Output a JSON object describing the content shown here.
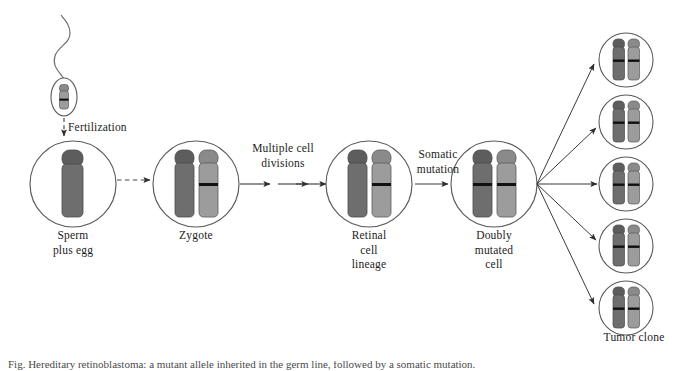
{
  "diagram": {
    "colors": {
      "outline": "#555555",
      "chromosome_dark": "#6e6e6e",
      "chromosome_light": "#9c9c9c",
      "chromosome_cap_dark": "#5d5d5d",
      "chromosome_cap_light": "#8a8a8a",
      "mutation_band": "#111111",
      "arrow": "#3a3a3a",
      "text": "#1c1c1c",
      "background": "#ffffff"
    },
    "stages": [
      {
        "id": "sperm-egg",
        "label": "Sperm\nplus egg",
        "cx": 73,
        "cy": 184,
        "r": 43,
        "chromosomes": [
          {
            "shade": "dark",
            "mutated": false
          }
        ]
      },
      {
        "id": "zygote",
        "label": "Zygote",
        "cx": 196,
        "cy": 184,
        "r": 43,
        "chromosomes": [
          {
            "shade": "dark",
            "mutated": false
          },
          {
            "shade": "light",
            "mutated": true
          }
        ]
      },
      {
        "id": "retinal-cell-lineage",
        "label": "Retinal\ncell\nlineage",
        "cx": 369,
        "cy": 184,
        "r": 43,
        "chromosomes": [
          {
            "shade": "dark",
            "mutated": false
          },
          {
            "shade": "light",
            "mutated": true
          }
        ]
      },
      {
        "id": "doubly-mutated-cell",
        "label": "Doubly\nmutated\ncell",
        "cx": 494,
        "cy": 184,
        "r": 43,
        "chromosomes": [
          {
            "shade": "dark",
            "mutated": true
          },
          {
            "shade": "light",
            "mutated": true
          }
        ]
      }
    ],
    "gamete": {
      "id": "sperm",
      "head_cx": 64,
      "head_cy": 97,
      "head_rx": 13,
      "head_ry": 19,
      "chromosome": {
        "shade": "light",
        "mutated": true
      }
    },
    "steps": [
      {
        "id": "fertilization",
        "label": "Fertilization",
        "x": 70,
        "y": 120,
        "style": "dashed-vertical"
      },
      {
        "id": "multiple-cell-divisions",
        "label": "Multiple cell\ndivisions",
        "x": 240,
        "y": 142,
        "style": "triple-arrow"
      },
      {
        "id": "somatic-mutation",
        "label": "Somatic\nmutation",
        "x": 409,
        "y": 148,
        "style": "single-arrow"
      }
    ],
    "tumor_clone": {
      "label": "Tumor clone",
      "label_x": 638,
      "label_y": 337,
      "count": 5,
      "cells": [
        {
          "cx": 626,
          "cy": 60,
          "r": 27
        },
        {
          "cx": 626,
          "cy": 122,
          "r": 27
        },
        {
          "cx": 626,
          "cy": 184,
          "r": 27
        },
        {
          "cx": 626,
          "cy": 246,
          "r": 27
        },
        {
          "cx": 626,
          "cy": 308,
          "r": 27
        },
        {
          "chromosomes": [
            {
              "shade": "dark",
              "mutated": true
            },
            {
              "shade": "light",
              "mutated": true
            }
          ]
        }
      ],
      "fan_origin": {
        "x": 537,
        "y": 184
      }
    },
    "caption": "Fig. Hereditary retinoblastoma: a mutant allele inherited in the germ line, followed by a somatic mutation."
  }
}
